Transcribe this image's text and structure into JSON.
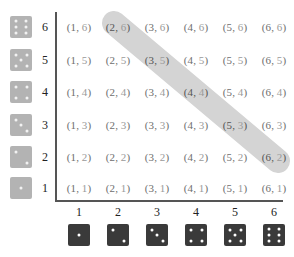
{
  "diagram": {
    "title": "",
    "row_labels": [
      "6",
      "5",
      "4",
      "3",
      "2",
      "1"
    ],
    "column_labels": [
      "1",
      "2",
      "3",
      "4",
      "5",
      "6"
    ],
    "row_values": [
      6,
      5,
      4,
      3,
      2,
      1
    ],
    "column_values": [
      1,
      2,
      3,
      4,
      5,
      6
    ],
    "cells": [
      [
        {
          "a": "1",
          "b": "6"
        },
        {
          "a": "2",
          "b": "6"
        },
        {
          "a": "3",
          "b": "6"
        },
        {
          "a": "4",
          "b": "6"
        },
        {
          "a": "5",
          "b": "6"
        },
        {
          "a": "6",
          "b": "6"
        }
      ],
      [
        {
          "a": "1",
          "b": "5"
        },
        {
          "a": "2",
          "b": "5"
        },
        {
          "a": "3",
          "b": "5"
        },
        {
          "a": "4",
          "b": "5"
        },
        {
          "a": "5",
          "b": "5"
        },
        {
          "a": "6",
          "b": "5"
        }
      ],
      [
        {
          "a": "1",
          "b": "4"
        },
        {
          "a": "2",
          "b": "4"
        },
        {
          "a": "3",
          "b": "4"
        },
        {
          "a": "4",
          "b": "4"
        },
        {
          "a": "5",
          "b": "4"
        },
        {
          "a": "6",
          "b": "4"
        }
      ],
      [
        {
          "a": "1",
          "b": "3"
        },
        {
          "a": "2",
          "b": "3"
        },
        {
          "a": "3",
          "b": "3"
        },
        {
          "a": "4",
          "b": "3"
        },
        {
          "a": "5",
          "b": "3"
        },
        {
          "a": "6",
          "b": "3"
        }
      ],
      [
        {
          "a": "1",
          "b": "2"
        },
        {
          "a": "2",
          "b": "2"
        },
        {
          "a": "3",
          "b": "2"
        },
        {
          "a": "4",
          "b": "2"
        },
        {
          "a": "5",
          "b": "2"
        },
        {
          "a": "6",
          "b": "2"
        }
      ],
      [
        {
          "a": "1",
          "b": "1"
        },
        {
          "a": "2",
          "b": "1"
        },
        {
          "a": "3",
          "b": "1"
        },
        {
          "a": "4",
          "b": "1"
        },
        {
          "a": "5",
          "b": "1"
        },
        {
          "a": "6",
          "b": "1"
        }
      ]
    ],
    "highlight": {
      "description": "Outcomes whose sum is 8",
      "from": [
        2,
        6
      ],
      "to": [
        6,
        2
      ],
      "cells": [
        [
          2,
          6
        ],
        [
          3,
          5
        ],
        [
          4,
          4
        ],
        [
          5,
          3
        ],
        [
          6,
          2
        ]
      ]
    },
    "colors": {
      "light_die": "#b3b3b3",
      "dark_die": "#3a3a3a",
      "band": "#d4d4d4",
      "axis": "#555555",
      "cell_text": "#6e6e6e",
      "cell_text_second": "#9a9a9a"
    }
  }
}
